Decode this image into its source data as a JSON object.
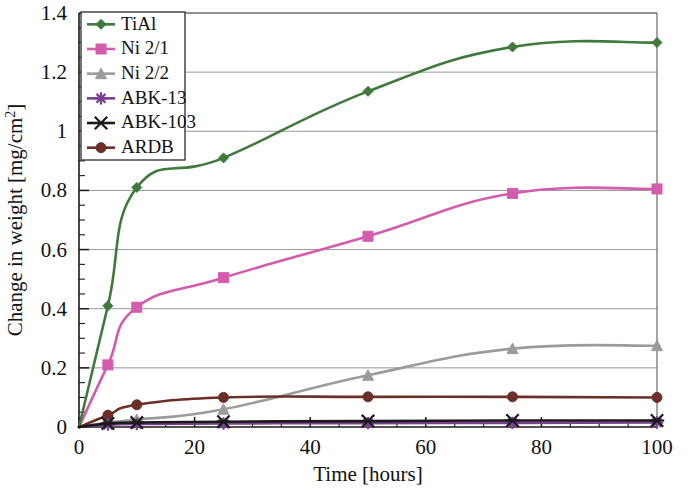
{
  "chart_data": {
    "type": "line",
    "title": "",
    "xlabel": "Time [hours]",
    "ylabel": "Change in weight [mg/cm2]",
    "ylabel_base": "Change in weight [mg/cm",
    "ylabel_sup": "2",
    "ylabel_tail": "]",
    "xlim": [
      0,
      100
    ],
    "ylim": [
      0,
      1.4
    ],
    "x_ticks": [
      0,
      20,
      40,
      60,
      80,
      100
    ],
    "x_tick_labels": [
      "0",
      "20",
      "40",
      "60",
      "80",
      "100"
    ],
    "y_ticks": [
      0,
      0.2,
      0.4,
      0.6,
      0.8,
      1.0,
      1.2,
      1.4
    ],
    "y_tick_labels": [
      "0",
      "0.2",
      "0.4",
      "0.6",
      "0.8",
      "1",
      "1.2",
      "1.4"
    ],
    "y_minor_step": 0.05,
    "grid": "horizontal-major",
    "legend_position": "top-left-inside",
    "x": [
      0,
      5,
      10,
      25,
      50,
      75,
      100
    ],
    "series": [
      {
        "name": "TiAl",
        "color": "#3f7a3d",
        "marker": "diamond",
        "values": [
          0.0,
          0.41,
          0.81,
          0.91,
          1.135,
          1.285,
          1.3
        ]
      },
      {
        "name": "Ni 2/1",
        "color": "#d35cae",
        "marker": "square",
        "values": [
          0.0,
          0.21,
          0.405,
          0.505,
          0.645,
          0.79,
          0.805
        ]
      },
      {
        "name": "Ni 2/2",
        "color": "#9b9b9b",
        "marker": "triangle",
        "values": [
          0.0,
          0.015,
          0.025,
          0.06,
          0.175,
          0.265,
          0.275
        ]
      },
      {
        "name": "ABK-13",
        "color": "#7b3f8f",
        "marker": "star",
        "values": [
          0.0,
          0.008,
          0.01,
          0.012,
          0.013,
          0.014,
          0.015
        ]
      },
      {
        "name": "ABK-103",
        "color": "#1a1a1a",
        "marker": "cross",
        "values": [
          0.0,
          0.012,
          0.015,
          0.018,
          0.02,
          0.022,
          0.022
        ]
      },
      {
        "name": "ARDB",
        "color": "#6b2f28",
        "marker": "circle",
        "values": [
          0.0,
          0.04,
          0.075,
          0.1,
          0.102,
          0.102,
          0.1
        ]
      }
    ]
  }
}
